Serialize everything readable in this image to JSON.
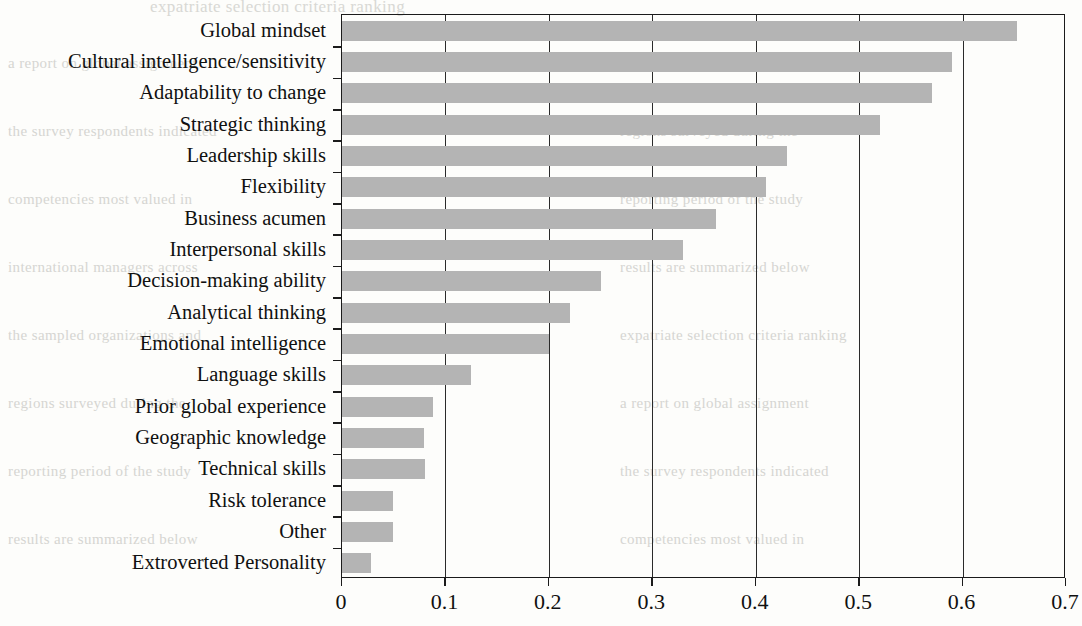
{
  "chart_data": {
    "type": "bar",
    "orientation": "horizontal",
    "title": "",
    "xlabel": "",
    "ylabel": "",
    "xlim": [
      0,
      0.7
    ],
    "xticks": [
      "0",
      "0.1",
      "0.2",
      "0.3",
      "0.4",
      "0.5",
      "0.6",
      "0.7"
    ],
    "xtick_values": [
      0,
      0.1,
      0.2,
      0.3,
      0.4,
      0.5,
      0.6,
      0.7
    ],
    "grid": "vertical",
    "legend": "none",
    "bar_color": "#b4b4b4",
    "axis_color": "#1b1b1b",
    "categories": [
      "Global mindset",
      "Cultural intelligence/sensitivity",
      "Adaptability to change",
      "Strategic thinking",
      "Leadership skills",
      "Flexibility",
      "Business acumen",
      "Interpersonal skills",
      "Decision-making ability",
      "Analytical thinking",
      "Emotional intelligence",
      "Language skills",
      "Prior global experience",
      "Geographic knowledge",
      "Technical skills",
      "Risk tolerance",
      "Other",
      "Extroverted Personality"
    ],
    "values": [
      0.653,
      0.59,
      0.57,
      0.52,
      0.43,
      0.41,
      0.362,
      0.33,
      0.25,
      0.22,
      0.2,
      0.125,
      0.088,
      0.079,
      0.08,
      0.049,
      0.049,
      0.028
    ]
  },
  "bleed_text": {
    "title": "scanned page bleed-through",
    "lines": [
      "expatriate selection criteria ranking",
      "a report on global assignment",
      "the survey respondents indicated",
      "competencies most valued in",
      "international managers across",
      "the sampled organizations and",
      "regions surveyed during the",
      "reporting period of the study",
      "results are summarized below"
    ]
  }
}
